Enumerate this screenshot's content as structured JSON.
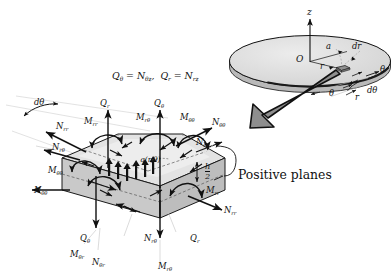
{
  "figure": {
    "background_color": "#ffffff",
    "ink_color": "#111111",
    "plate_fill": "#d9d9d9",
    "element_fill": "#cfcfcf",
    "element_top_fill": "#e2e2e2",
    "element_dark_fill": "#9a9a9a",
    "arrow_gray": "#8c8c8c"
  },
  "equation": {
    "relation_1": "Q",
    "relation_1_sub": "θ",
    "relation_1_eq": " = N",
    "relation_1_rhs_sub": "θz",
    "relation_1_sep": ",",
    "relation_2": "Q",
    "relation_2_sub": "r",
    "relation_2_eq": " = N",
    "relation_2_rhs_sub": "rz",
    "full_text": "Qθ = Nθz ,  Qr = Nrz"
  },
  "disk": {
    "axis_label_z": "z",
    "origin_label": "O",
    "radius_label": "a",
    "dr_label": "dr",
    "r_label": "r",
    "r_label_lower": "r",
    "theta_label_right": "θ",
    "theta_label_lower": "θ",
    "dtheta_label": "dθ"
  },
  "element": {
    "dtheta_arc_label": "dθ",
    "distributed_load_label": "q(r,θ)",
    "thickness_label_num": "h",
    "thickness_label_den": "2",
    "caption": "Positive planes"
  },
  "resultants": {
    "top_Qr": {
      "sym": "Q",
      "sub": "r"
    },
    "top_Mrr": {
      "sym": "M",
      "sub": "rr"
    },
    "top_Mrtheta": {
      "sym": "M",
      "sub": "rθ"
    },
    "top_Qtheta": {
      "sym": "Q",
      "sub": "θ"
    },
    "top_Mthetatheta": {
      "sym": "M",
      "sub": "θθ"
    },
    "top_Nthetatheta": {
      "sym": "N",
      "sub": "θθ"
    },
    "left_Nrr": {
      "sym": "N",
      "sub": "rr"
    },
    "left_Nrtheta": {
      "sym": "N",
      "sub": "rθ"
    },
    "left_Mthetatheta": {
      "sym": "M",
      "sub": "θθ"
    },
    "left_Nthetatheta": {
      "sym": "N",
      "sub": "θθ"
    },
    "right_Nrtheta": {
      "sym": "N",
      "sub": "rθ"
    },
    "right_Mrr": {
      "sym": "M",
      "sub": "rr"
    },
    "right_Nrr": {
      "sym": "N",
      "sub": "rr"
    },
    "bot_Qtheta": {
      "sym": "Q",
      "sub": "θ"
    },
    "bot_Mthetar": {
      "sym": "M",
      "sub": "θr"
    },
    "bot_Nthetar": {
      "sym": "N",
      "sub": "θr"
    },
    "bot_Nrtheta": {
      "sym": "N",
      "sub": "rθ"
    },
    "bot_Qr": {
      "sym": "Q",
      "sub": "r"
    },
    "bot_Mrtheta": {
      "sym": "M",
      "sub": "rθ"
    }
  }
}
